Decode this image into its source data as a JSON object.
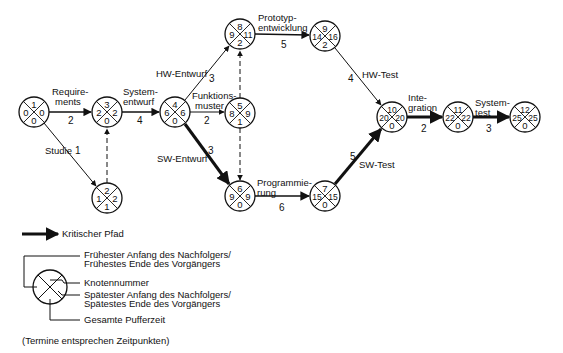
{
  "diagram": {
    "type": "network-plan",
    "nodes": [
      {
        "id": "1",
        "cx": 34,
        "cy": 112,
        "top": "1",
        "left": "0",
        "right": "0",
        "bottom": "0"
      },
      {
        "id": "2",
        "cx": 107,
        "cy": 198,
        "top": "2",
        "left": "1",
        "right": "2",
        "bottom": "1"
      },
      {
        "id": "3",
        "cx": 107,
        "cy": 112,
        "top": "3",
        "left": "2",
        "right": "2",
        "bottom": "0"
      },
      {
        "id": "4",
        "cx": 175,
        "cy": 112,
        "top": "4",
        "left": "6",
        "right": "6",
        "bottom": "0"
      },
      {
        "id": "5",
        "cx": 240,
        "cy": 113,
        "top": "5",
        "left": "8",
        "right": "9",
        "bottom": "1"
      },
      {
        "id": "6",
        "cx": 240,
        "cy": 196,
        "top": "6",
        "left": "9",
        "right": "9",
        "bottom": "0"
      },
      {
        "id": "7",
        "cx": 325,
        "cy": 196,
        "top": "7",
        "left": "15",
        "right": "15",
        "bottom": "0"
      },
      {
        "id": "8",
        "cx": 240,
        "cy": 34,
        "top": "8",
        "left": "9",
        "right": "11",
        "bottom": "2"
      },
      {
        "id": "9",
        "cx": 325,
        "cy": 36,
        "top": "9",
        "left": "14",
        "right": "16",
        "bottom": "2"
      },
      {
        "id": "10",
        "cx": 392,
        "cy": 117,
        "top": "10",
        "left": "20",
        "right": "20",
        "bottom": "0"
      },
      {
        "id": "11",
        "cx": 458,
        "cy": 117,
        "top": "11",
        "left": "22",
        "right": "22",
        "bottom": "0"
      },
      {
        "id": "12",
        "cx": 525,
        "cy": 117,
        "top": "12",
        "left": "25",
        "right": "25",
        "bottom": "0"
      }
    ],
    "activities": [
      {
        "from": "1",
        "to": "3",
        "name": "Requirements",
        "label_lines": [
          "Requirements"
        ],
        "duration": "2",
        "critical": false
      },
      {
        "from": "1",
        "to": "2",
        "name": "Studie",
        "label_lines": [
          "Studie"
        ],
        "duration": "1",
        "critical": false
      },
      {
        "from": "2",
        "to": "3",
        "name": "Scheinvorgang",
        "duration": "",
        "dummy": true
      },
      {
        "from": "3",
        "to": "4",
        "name": "Systementwurf",
        "duration": "4",
        "critical": false
      },
      {
        "from": "4",
        "to": "8",
        "name": "HW-Entwurf",
        "duration": "3",
        "critical": false
      },
      {
        "from": "4",
        "to": "5",
        "name": "Funktionsmuster",
        "duration": "2",
        "critical": false
      },
      {
        "from": "4",
        "to": "6",
        "name": "SW-Entwurf",
        "duration": "3",
        "critical": true
      },
      {
        "from": "5",
        "to": "8",
        "name": "Scheinvorgang",
        "duration": "",
        "dummy": true
      },
      {
        "from": "5",
        "to": "6",
        "name": "Scheinvorgang",
        "duration": "",
        "dummy": true
      },
      {
        "from": "8",
        "to": "9",
        "name": "Prototypentwicklung",
        "duration": "5",
        "critical": false
      },
      {
        "from": "6",
        "to": "7",
        "name": "Programmierung",
        "duration": "6",
        "critical": true
      },
      {
        "from": "9",
        "to": "10",
        "name": "HW-Test",
        "duration": "4",
        "critical": false
      },
      {
        "from": "7",
        "to": "10",
        "name": "SW-Test",
        "duration": "5",
        "critical": true
      },
      {
        "from": "10",
        "to": "11",
        "name": "Integration",
        "duration": "2",
        "critical": true
      },
      {
        "from": "11",
        "to": "12",
        "name": "Systemtest",
        "duration": "3",
        "critical": true
      }
    ]
  },
  "labels": {
    "requirements_1": "Requirements",
    "requirements_2": "ments",
    "requirements_a": "Require-",
    "req_dur": "2",
    "studie": "Studie",
    "studie_dur": "1",
    "systementwurf_a": "System-",
    "systementwurf_b": "entwurf",
    "sys_dur": "4",
    "hw_entwurf": "HW-Entwurf",
    "hw_entwurf_dur": "3",
    "funktionsmuster_a": "Funktions-",
    "funktionsmuster_b": "muster",
    "funk_dur": "2",
    "sw_entwurf": "SW-Entwurf",
    "sw_entwurf_dur": "3",
    "prototyp_a": "Prototyp-",
    "prototyp_b": "entwicklung",
    "proto_dur": "5",
    "programmierung_a": "Programmie-",
    "programmierung_b": "rung",
    "prog_dur": "6",
    "hw_test": "HW-Test",
    "hw_test_dur": "4",
    "sw_test": "SW-Test",
    "sw_test_dur": "5",
    "integration_a": "Inte-",
    "integration_b": "gration",
    "integ_dur": "2",
    "systemtest_a": "System-",
    "systemtest_b": "test",
    "systest_dur": "3"
  },
  "legend": {
    "critical_path": "Kritischer Pfad",
    "top_line1": "Frühester Anfang des Nachfolgers/",
    "top_line2": "Frühestes Ende des Vorgängers",
    "node_number": "Knotennummer",
    "right_line1": "Spätester Anfang des Nachfolgers/",
    "right_line2": "Spätestes Ende des Vorgängers",
    "float": "Gesamte Pufferzeit",
    "note": "(Termine entsprechen Zeitpunkten)"
  }
}
